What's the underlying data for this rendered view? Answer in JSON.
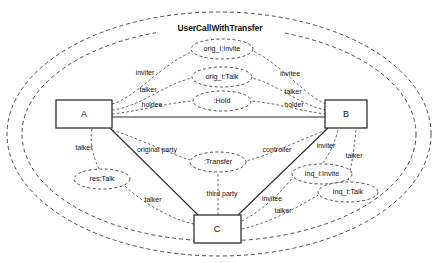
{
  "diagram": {
    "title": "UserCallWithTransfer",
    "type": "uml-collaboration-diagram",
    "outer_boundary": {
      "shape": "dashed-ellipse",
      "count": 2
    },
    "objects": [
      {
        "id": "A",
        "kind": "box",
        "label": "A",
        "x": 84,
        "y": 114,
        "w": 56,
        "h": 28
      },
      {
        "id": "B",
        "kind": "box",
        "label": "B",
        "x": 346,
        "y": 114,
        "w": 42,
        "h": 28
      },
      {
        "id": "C",
        "kind": "box",
        "label": "C",
        "x": 217,
        "y": 229,
        "w": 47,
        "h": 28
      },
      {
        "id": "orig_i",
        "kind": "ellipse",
        "label": "orig_i:Invite",
        "x": 222,
        "y": 49,
        "rx": 31,
        "ry": 10
      },
      {
        "id": "orig_t",
        "kind": "ellipse",
        "label": "orig_t:Talk",
        "x": 222,
        "y": 77,
        "rx": 30,
        "ry": 10
      },
      {
        "id": "hold",
        "kind": "ellipse",
        "label": ":Hold",
        "x": 222,
        "y": 101,
        "rx": 29,
        "ry": 10
      },
      {
        "id": "res_talk",
        "kind": "ellipse",
        "label": "res:Talk",
        "x": 102,
        "y": 179,
        "rx": 28,
        "ry": 10
      },
      {
        "id": "transfer",
        "kind": "ellipse",
        "label": ":Transfer",
        "x": 218,
        "y": 162,
        "rx": 28,
        "ry": 10
      },
      {
        "id": "inq_i",
        "kind": "ellipse",
        "label": "inq_i:Invite",
        "x": 322,
        "y": 174,
        "rx": 30,
        "ry": 10
      },
      {
        "id": "inq_t",
        "kind": "ellipse",
        "label": "inq_t:Talk",
        "x": 348,
        "y": 192,
        "rx": 30,
        "ry": 10
      }
    ],
    "links": [
      {
        "from": "A",
        "to": "B",
        "style": "solid"
      },
      {
        "from": "A",
        "to": "C",
        "style": "solid"
      },
      {
        "from": "B",
        "to": "C",
        "style": "solid"
      },
      {
        "from": "A",
        "to": "orig_i",
        "style": "dotted",
        "role": "inviter"
      },
      {
        "from": "A",
        "to": "orig_t",
        "style": "dotted",
        "role": "talker"
      },
      {
        "from": "A",
        "to": "hold",
        "style": "dotted",
        "role": "holdee"
      },
      {
        "from": "B",
        "to": "orig_i",
        "style": "dotted",
        "role": "invitee"
      },
      {
        "from": "B",
        "to": "orig_t",
        "style": "dotted",
        "role": "talker"
      },
      {
        "from": "B",
        "to": "hold",
        "style": "dotted",
        "role": "holder"
      },
      {
        "from": "A",
        "to": "res_talk",
        "style": "dotted",
        "role": "talker"
      },
      {
        "from": "C",
        "to": "res_talk",
        "style": "dotted",
        "role": "talker"
      },
      {
        "from": "A",
        "to": "transfer",
        "style": "dotted",
        "role": "original party"
      },
      {
        "from": "B",
        "to": "transfer",
        "style": "dotted",
        "role": "controller"
      },
      {
        "from": "C",
        "to": "transfer",
        "style": "dotted",
        "role": "third party"
      },
      {
        "from": "B",
        "to": "inq_i",
        "style": "dotted",
        "role": "inviter"
      },
      {
        "from": "B",
        "to": "inq_t",
        "style": "dotted",
        "role": "talker"
      },
      {
        "from": "C",
        "to": "inq_i",
        "style": "dotted",
        "role": "invitee"
      },
      {
        "from": "C",
        "to": "inq_t",
        "style": "dotted",
        "role": "talker"
      }
    ],
    "role_labels": [
      {
        "text": "inviter",
        "x": 145,
        "y": 73
      },
      {
        "text": "talker",
        "x": 148,
        "y": 90
      },
      {
        "text": "holdee",
        "x": 152,
        "y": 105
      },
      {
        "text": "invitee",
        "x": 290,
        "y": 74
      },
      {
        "text": "talker",
        "x": 293,
        "y": 92
      },
      {
        "text": "holder",
        "x": 294,
        "y": 105
      },
      {
        "text": "talker",
        "x": 84,
        "y": 148
      },
      {
        "text": "original party",
        "x": 157,
        "y": 150
      },
      {
        "text": "controller",
        "x": 277,
        "y": 150
      },
      {
        "text": "third party",
        "x": 222,
        "y": 194
      },
      {
        "text": "talker",
        "x": 153,
        "y": 200
      },
      {
        "text": "invitee",
        "x": 272,
        "y": 199
      },
      {
        "text": "talker",
        "x": 283,
        "y": 211
      },
      {
        "text": "inviter",
        "x": 326,
        "y": 146
      },
      {
        "text": "talker",
        "x": 354,
        "y": 156
      }
    ],
    "colors": {
      "background": "#ffffff",
      "solid_line": "#2b2b2b",
      "dashed_line": "#3a3a3a",
      "text": "#111111"
    }
  }
}
